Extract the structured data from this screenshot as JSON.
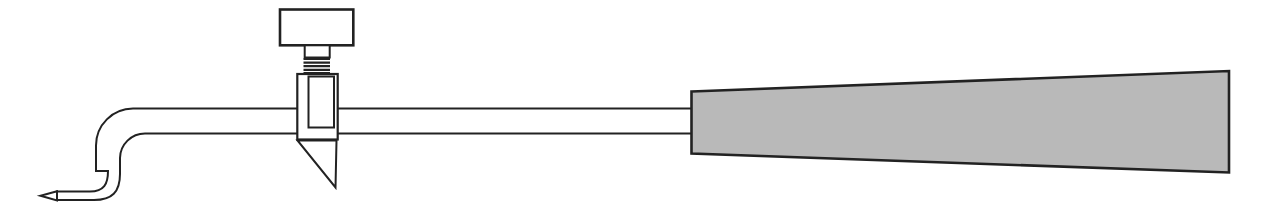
{
  "figure": {
    "title": "Blowpipe with regulating valve",
    "colors": {
      "background": "#ffffff",
      "outline": "#222222",
      "metal_fill": "#ffffff",
      "handle_fill": "#b9b9b9"
    },
    "parts": [
      {
        "id": "jet-tip",
        "label": "pointed jet tip"
      },
      {
        "id": "curved-neck",
        "label": "down-curved neck tube"
      },
      {
        "id": "stem-tube",
        "label": "straight stem tube"
      },
      {
        "id": "valve-knob",
        "label": "valve thumb knob"
      },
      {
        "id": "valve-neck",
        "label": "valve spindle neck"
      },
      {
        "id": "valve-threads",
        "label": "threaded valve spindle"
      },
      {
        "id": "valve-body",
        "label": "valve body"
      },
      {
        "id": "valve-plug",
        "label": "valve plug insert"
      },
      {
        "id": "valve-cone",
        "label": "conical valve spike"
      },
      {
        "id": "handle",
        "label": "tapered mouthpiece handle"
      }
    ]
  }
}
